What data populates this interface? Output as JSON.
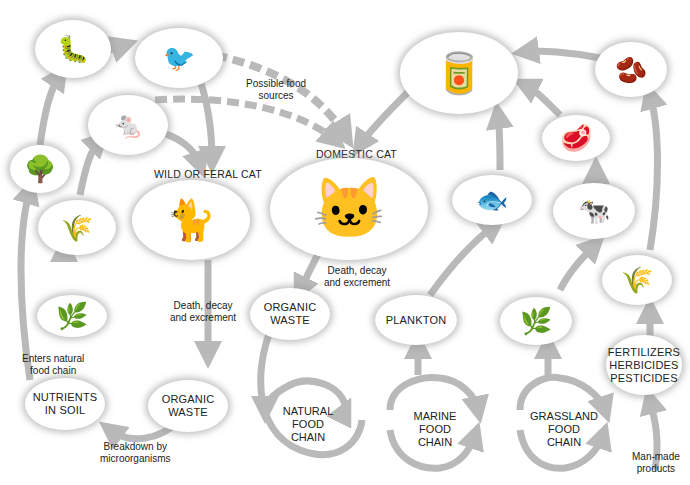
{
  "diagram": {
    "type": "food-chain-cycle",
    "colors": {
      "arrow": "#b9b9b9",
      "node_fill": "#ffffff",
      "node_shadow": "#969696",
      "text": "#222222"
    }
  },
  "nodes": {
    "caterpillar": {
      "icon": "caterpillar-icon",
      "glyph": "🐛"
    },
    "bird": {
      "icon": "bird-icon",
      "glyph": "🐦"
    },
    "mouse": {
      "icon": "mouse-icon",
      "glyph": "🐁"
    },
    "tree": {
      "icon": "tree-icon",
      "glyph": "🌳"
    },
    "seeds": {
      "icon": "seeds-icon",
      "glyph": "🌾"
    },
    "grass_left": {
      "icon": "grass-icon",
      "glyph": "🌿"
    },
    "wild_cat": {
      "label": "WILD OR FERAL CAT",
      "icon": "wild-cat-icon",
      "glyph": "🐈"
    },
    "domestic_cat": {
      "label": "DOMESTIC CAT",
      "icon": "domestic-cat-icon",
      "glyph": "🐱"
    },
    "cat_food": {
      "icon": "cat-food-icon",
      "glyph": "🥫"
    },
    "wheat_grains": {
      "icon": "grain-icon",
      "glyph": "🫘"
    },
    "meat": {
      "icon": "meat-icon",
      "glyph": "🥩"
    },
    "fish": {
      "icon": "fish-icon",
      "glyph": "🐟"
    },
    "cow": {
      "icon": "cow-icon",
      "glyph": "🐄"
    },
    "grass_right": {
      "icon": "grass-icon",
      "glyph": "🌿"
    },
    "wheat": {
      "icon": "wheat-icon",
      "glyph": "🌾"
    },
    "nutrients": {
      "label": "NUTRIENTS\nIN SOIL"
    },
    "organic_waste_left": {
      "label": "ORGANIC\nWASTE"
    },
    "organic_waste_mid": {
      "label": "ORGANIC\nWASTE"
    },
    "plankton": {
      "label": "PLANKTON"
    },
    "fertilizers": {
      "label": "FERTILIZERS\nHERBICIDES\nPESTICIDES"
    }
  },
  "chains": {
    "natural": "NATURAL\nFOOD\nCHAIN",
    "marine": "MARINE\nFOOD\nCHAIN",
    "grassland": "GRASSLAND\nFOOD\nCHAIN"
  },
  "annotations": {
    "possible_food": "Possible food\nsources",
    "death_left": "Death, decay\nand excrement",
    "death_mid": "Death, decay\nand excrement",
    "enters_chain": "Enters natural\nfood chain",
    "breakdown": "Breakdown by\nmicroorganisms",
    "man_made": "Man-made\nproducts"
  }
}
